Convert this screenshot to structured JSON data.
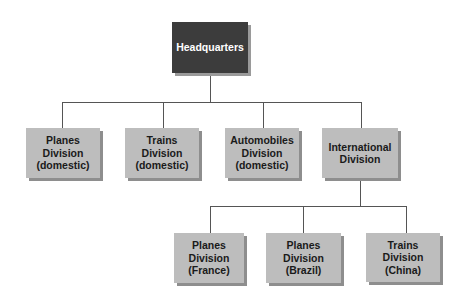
{
  "diagram": {
    "type": "org-chart",
    "root": {
      "label": "Headquarters",
      "lines": [
        "Headquarters"
      ],
      "color": "#3c3c3c"
    },
    "level1": [
      {
        "label": "Planes Division (domestic)",
        "lines": [
          "Planes",
          "Division",
          "(domestic)"
        ]
      },
      {
        "label": "Trains Division (domestic)",
        "lines": [
          "Trains",
          "Division",
          "(domestic)"
        ]
      },
      {
        "label": "Automobiles Division (domestic)",
        "lines": [
          "Automobiles",
          "Division",
          "(domestic)"
        ]
      },
      {
        "label": "International Division",
        "lines": [
          "International",
          "Division"
        ]
      }
    ],
    "level2_parent": "International Division",
    "level2": [
      {
        "label": "Planes Division (France)",
        "lines": [
          "Planes",
          "Division",
          "(France)"
        ]
      },
      {
        "label": "Planes Division (Brazil)",
        "lines": [
          "Planes",
          "Division",
          "(Brazil)"
        ]
      },
      {
        "label": "Trains Division (China)",
        "lines": [
          "Trains",
          "Division",
          "(China)"
        ]
      }
    ],
    "colors": {
      "root_fill": "#3c3c3c",
      "root_text": "#ffffff",
      "node_fill": "#bdbdbd",
      "node_text": "#1a1a1a",
      "connector": "#555555"
    }
  }
}
